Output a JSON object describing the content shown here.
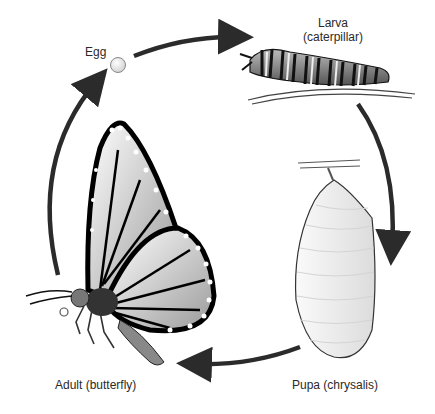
{
  "diagram": {
    "stages": [
      {
        "id": "egg",
        "label": "Egg"
      },
      {
        "id": "larva",
        "label_line1": "Larva",
        "label_line2": "(caterpillar)"
      },
      {
        "id": "pupa",
        "label": "Pupa (chrysalis)"
      },
      {
        "id": "adult",
        "label": "Adult (butterfly)"
      }
    ],
    "arrows": [
      {
        "from": "egg",
        "to": "larva"
      },
      {
        "from": "larva",
        "to": "pupa"
      },
      {
        "from": "pupa",
        "to": "adult"
      },
      {
        "from": "adult",
        "to": "egg"
      }
    ],
    "colors": {
      "arrow": "#2b2b2b",
      "outline": "#111111",
      "fill_light": "#f2f2f2",
      "text": "#2a2a2a"
    }
  }
}
